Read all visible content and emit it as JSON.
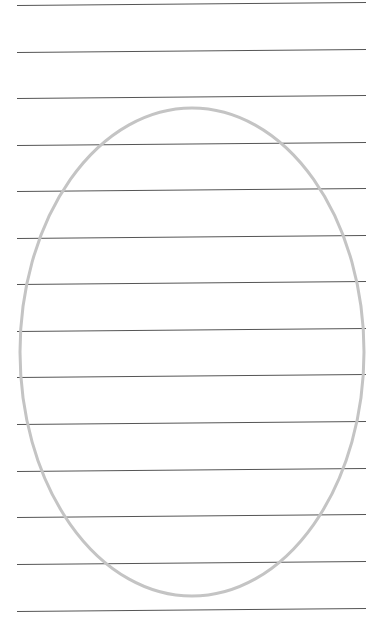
{
  "page": {
    "background": "#ffffff",
    "width": 388,
    "height": 638
  },
  "ruled_lines": {
    "color": "#555555",
    "stroke_width": 1,
    "x_start": 17,
    "x_end": 366,
    "right_rise": 3,
    "y_positions": [
      5,
      52,
      98,
      145,
      191,
      238,
      284,
      331,
      377,
      424,
      471,
      517,
      564,
      611
    ]
  },
  "ellipse": {
    "cx": 192,
    "cy": 352,
    "rx": 172,
    "ry": 244,
    "stroke_color": "#c4c4c4",
    "stroke_width": 3,
    "fill": "none"
  }
}
